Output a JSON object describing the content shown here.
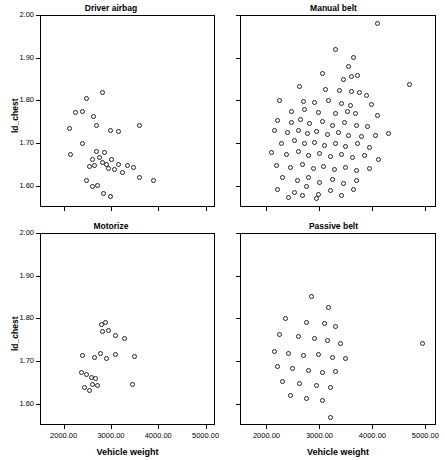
{
  "chart_data": {
    "type": "scatter",
    "title": "",
    "xlabel": "Vehicle weight",
    "ylabel": "ld_chest",
    "xlim": [
      1500,
      5200
    ],
    "ylim": [
      1.55,
      2.0
    ],
    "xticks": [
      "2000.00",
      "3000.00",
      "4000.00",
      "5000.00"
    ],
    "xtickvals": [
      2000,
      3000,
      4000,
      5000
    ],
    "yticks": [
      "1.60",
      "1.70",
      "1.80",
      "1.90",
      "2.00"
    ],
    "ytickvals": [
      1.6,
      1.7,
      1.8,
      1.9,
      2.0
    ],
    "grid": false,
    "legend": null,
    "panels": [
      {
        "title": "Driver airbag",
        "points": [
          [
            2250,
            1.772
          ],
          [
            2400,
            1.775
          ],
          [
            2480,
            1.805
          ],
          [
            2820,
            1.818
          ],
          [
            2130,
            1.735
          ],
          [
            2630,
            1.762
          ],
          [
            2700,
            1.742
          ],
          [
            2980,
            1.73
          ],
          [
            3150,
            1.728
          ],
          [
            3600,
            1.74
          ],
          [
            2150,
            1.672
          ],
          [
            2400,
            1.7
          ],
          [
            2550,
            1.645
          ],
          [
            2600,
            1.662
          ],
          [
            2660,
            1.648
          ],
          [
            2700,
            1.68
          ],
          [
            2760,
            1.665
          ],
          [
            2830,
            1.655
          ],
          [
            2860,
            1.678
          ],
          [
            2900,
            1.65
          ],
          [
            2950,
            1.64
          ],
          [
            3020,
            1.662
          ],
          [
            3080,
            1.638
          ],
          [
            3150,
            1.65
          ],
          [
            3250,
            1.63
          ],
          [
            3350,
            1.648
          ],
          [
            3480,
            1.642
          ],
          [
            3600,
            1.62
          ],
          [
            3900,
            1.612
          ],
          [
            2480,
            1.612
          ],
          [
            2600,
            1.598
          ],
          [
            2720,
            1.6
          ],
          [
            2850,
            1.582
          ],
          [
            3000,
            1.575
          ]
        ]
      },
      {
        "title": "Manual belt",
        "points": [
          [
            4100,
            1.98
          ],
          [
            3300,
            1.918
          ],
          [
            3650,
            1.9
          ],
          [
            3550,
            1.88
          ],
          [
            3050,
            1.862
          ],
          [
            3600,
            1.855
          ],
          [
            3720,
            1.858
          ],
          [
            3450,
            1.848
          ],
          [
            4700,
            1.838
          ],
          [
            2620,
            1.832
          ],
          [
            3120,
            1.825
          ],
          [
            3380,
            1.822
          ],
          [
            3600,
            1.82
          ],
          [
            3760,
            1.818
          ],
          [
            3880,
            1.812
          ],
          [
            2250,
            1.8
          ],
          [
            2700,
            1.798
          ],
          [
            2900,
            1.795
          ],
          [
            3180,
            1.8
          ],
          [
            3420,
            1.792
          ],
          [
            3580,
            1.788
          ],
          [
            3980,
            1.79
          ],
          [
            2480,
            1.775
          ],
          [
            2720,
            1.778
          ],
          [
            2980,
            1.772
          ],
          [
            3300,
            1.77
          ],
          [
            3520,
            1.775
          ],
          [
            3680,
            1.768
          ],
          [
            4100,
            1.765
          ],
          [
            2200,
            1.752
          ],
          [
            2480,
            1.748
          ],
          [
            2650,
            1.755
          ],
          [
            2820,
            1.745
          ],
          [
            3050,
            1.75
          ],
          [
            3250,
            1.742
          ],
          [
            3480,
            1.748
          ],
          [
            3700,
            1.74
          ],
          [
            3900,
            1.738
          ],
          [
            2150,
            1.73
          ],
          [
            2400,
            1.725
          ],
          [
            2600,
            1.73
          ],
          [
            2780,
            1.722
          ],
          [
            2950,
            1.728
          ],
          [
            3150,
            1.72
          ],
          [
            3350,
            1.725
          ],
          [
            3550,
            1.718
          ],
          [
            3800,
            1.715
          ],
          [
            4050,
            1.718
          ],
          [
            4300,
            1.722
          ],
          [
            2280,
            1.7
          ],
          [
            2520,
            1.705
          ],
          [
            2720,
            1.698
          ],
          [
            2900,
            1.702
          ],
          [
            3100,
            1.695
          ],
          [
            3300,
            1.7
          ],
          [
            3500,
            1.692
          ],
          [
            3720,
            1.698
          ],
          [
            3950,
            1.69
          ],
          [
            2100,
            1.678
          ],
          [
            2380,
            1.672
          ],
          [
            2600,
            1.68
          ],
          [
            2800,
            1.67
          ],
          [
            3000,
            1.675
          ],
          [
            3200,
            1.668
          ],
          [
            3420,
            1.672
          ],
          [
            3620,
            1.665
          ],
          [
            3850,
            1.67
          ],
          [
            4120,
            1.662
          ],
          [
            2180,
            1.648
          ],
          [
            2450,
            1.642
          ],
          [
            2680,
            1.65
          ],
          [
            2880,
            1.64
          ],
          [
            3080,
            1.645
          ],
          [
            3280,
            1.638
          ],
          [
            3500,
            1.642
          ],
          [
            3700,
            1.635
          ],
          [
            3950,
            1.64
          ],
          [
            2300,
            1.618
          ],
          [
            2580,
            1.612
          ],
          [
            2800,
            1.62
          ],
          [
            3000,
            1.608
          ],
          [
            3250,
            1.615
          ],
          [
            3450,
            1.605
          ],
          [
            3700,
            1.612
          ],
          [
            2200,
            1.592
          ],
          [
            2520,
            1.585
          ],
          [
            2750,
            1.598
          ],
          [
            2980,
            1.58
          ],
          [
            3200,
            1.588
          ],
          [
            3420,
            1.578
          ],
          [
            3650,
            1.59
          ],
          [
            2420,
            1.572
          ],
          [
            2680,
            1.578
          ],
          [
            2950,
            1.57
          ]
        ]
      },
      {
        "title": "Motorize",
        "points": [
          [
            2800,
            1.785
          ],
          [
            2880,
            1.79
          ],
          [
            2830,
            1.768
          ],
          [
            2950,
            1.772
          ],
          [
            3100,
            1.76
          ],
          [
            3280,
            1.752
          ],
          [
            2400,
            1.712
          ],
          [
            2650,
            1.708
          ],
          [
            2780,
            1.718
          ],
          [
            2900,
            1.705
          ],
          [
            3100,
            1.715
          ],
          [
            3500,
            1.71
          ],
          [
            2380,
            1.672
          ],
          [
            2480,
            1.668
          ],
          [
            2580,
            1.662
          ],
          [
            2680,
            1.658
          ],
          [
            2620,
            1.645
          ],
          [
            2720,
            1.642
          ],
          [
            2450,
            1.638
          ],
          [
            2550,
            1.63
          ],
          [
            3450,
            1.645
          ]
        ]
      },
      {
        "title": "Passive belt",
        "points": [
          [
            2850,
            1.852
          ],
          [
            3180,
            1.825
          ],
          [
            2350,
            1.8
          ],
          [
            2750,
            1.79
          ],
          [
            3100,
            1.788
          ],
          [
            3300,
            1.782
          ],
          [
            2250,
            1.762
          ],
          [
            2600,
            1.758
          ],
          [
            2900,
            1.752
          ],
          [
            3150,
            1.748
          ],
          [
            3400,
            1.742
          ],
          [
            4950,
            1.742
          ],
          [
            2150,
            1.722
          ],
          [
            2420,
            1.718
          ],
          [
            2700,
            1.712
          ],
          [
            2980,
            1.715
          ],
          [
            3250,
            1.708
          ],
          [
            3500,
            1.705
          ],
          [
            2200,
            1.688
          ],
          [
            2500,
            1.682
          ],
          [
            2800,
            1.678
          ],
          [
            3050,
            1.672
          ],
          [
            3300,
            1.675
          ],
          [
            2300,
            1.652
          ],
          [
            2620,
            1.648
          ],
          [
            2950,
            1.642
          ],
          [
            3200,
            1.638
          ],
          [
            2450,
            1.618
          ],
          [
            2750,
            1.612
          ],
          [
            3050,
            1.608
          ],
          [
            3200,
            1.568
          ]
        ]
      }
    ]
  }
}
